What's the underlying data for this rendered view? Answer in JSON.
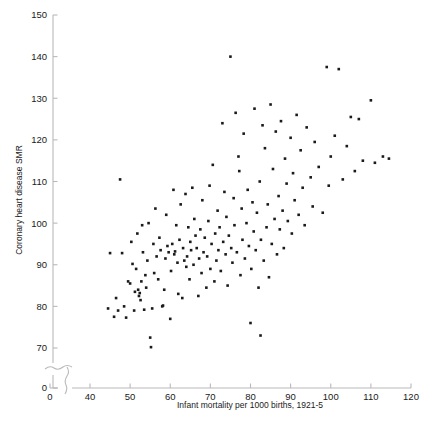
{
  "chart_data": {
    "type": "scatter",
    "title": "",
    "xlabel": "Infant mortality per 1000 births, 1921-5",
    "ylabel": "Coronary heart disease SMR",
    "xlim": [
      40,
      120
    ],
    "ylim": [
      70,
      150
    ],
    "x_ticks": [
      40,
      50,
      60,
      70,
      80,
      90,
      100,
      110,
      120
    ],
    "y_ticks": [
      70,
      80,
      90,
      100,
      110,
      120,
      130,
      140,
      150
    ],
    "x_origin_tick": 0,
    "y_origin_tick": 0,
    "axis_break": true,
    "grid": false,
    "legend": false,
    "marker": {
      "shape": "square",
      "size": 2.6,
      "color": "#1a1a1a"
    },
    "axis_color": "#b9b9b9",
    "n_points": 176,
    "points": [
      [
        44.5,
        79.5
      ],
      [
        45.0,
        92.8
      ],
      [
        46.0,
        77.5
      ],
      [
        46.5,
        82.0
      ],
      [
        47.0,
        79.0
      ],
      [
        47.5,
        110.5
      ],
      [
        48.0,
        92.8
      ],
      [
        48.5,
        80.0
      ],
      [
        49.0,
        77.3
      ],
      [
        49.5,
        86.0
      ],
      [
        50.0,
        85.5
      ],
      [
        50.3,
        95.5
      ],
      [
        50.6,
        90.2
      ],
      [
        51.0,
        79.0
      ],
      [
        51.2,
        83.5
      ],
      [
        51.5,
        89.0
      ],
      [
        51.8,
        97.5
      ],
      [
        52.0,
        84.0
      ],
      [
        52.2,
        82.5
      ],
      [
        52.4,
        83.2
      ],
      [
        52.6,
        81.5
      ],
      [
        52.8,
        86.0
      ],
      [
        53.0,
        99.5
      ],
      [
        53.2,
        93.0
      ],
      [
        53.5,
        79.2
      ],
      [
        53.8,
        87.5
      ],
      [
        54.0,
        84.5
      ],
      [
        54.3,
        91.0
      ],
      [
        54.6,
        100.0
      ],
      [
        55.0,
        72.5
      ],
      [
        55.2,
        70.2
      ],
      [
        55.5,
        79.5
      ],
      [
        55.8,
        95.0
      ],
      [
        56.0,
        88.0
      ],
      [
        56.3,
        103.5
      ],
      [
        56.6,
        92.0
      ],
      [
        57.0,
        86.5
      ],
      [
        57.3,
        96.5
      ],
      [
        57.6,
        93.5
      ],
      [
        58.0,
        80.0
      ],
      [
        58.2,
        80.2
      ],
      [
        58.5,
        84.0
      ],
      [
        58.8,
        91.5
      ],
      [
        59.0,
        102.0
      ],
      [
        59.3,
        94.5
      ],
      [
        59.6,
        93.0
      ],
      [
        60.0,
        77.0
      ],
      [
        60.2,
        88.5
      ],
      [
        60.5,
        95.0
      ],
      [
        60.8,
        108.0
      ],
      [
        61.0,
        92.5
      ],
      [
        61.2,
        93.2
      ],
      [
        61.5,
        99.5
      ],
      [
        61.8,
        90.5
      ],
      [
        62.0,
        83.0
      ],
      [
        62.3,
        96.0
      ],
      [
        62.6,
        104.5
      ],
      [
        63.0,
        82.0
      ],
      [
        63.2,
        94.0
      ],
      [
        63.5,
        91.0
      ],
      [
        63.8,
        107.0
      ],
      [
        64.0,
        89.5
      ],
      [
        64.2,
        92.0
      ],
      [
        64.5,
        99.0
      ],
      [
        64.8,
        86.5
      ],
      [
        65.0,
        95.5
      ],
      [
        65.2,
        93.5
      ],
      [
        65.5,
        108.5
      ],
      [
        65.8,
        90.0
      ],
      [
        66.0,
        101.0
      ],
      [
        66.3,
        97.0
      ],
      [
        66.6,
        94.0
      ],
      [
        67.0,
        82.5
      ],
      [
        67.2,
        91.5
      ],
      [
        67.5,
        98.5
      ],
      [
        67.8,
        88.0
      ],
      [
        68.0,
        105.5
      ],
      [
        68.3,
        93.0
      ],
      [
        68.6,
        96.5
      ],
      [
        69.0,
        84.5
      ],
      [
        69.2,
        92.0
      ],
      [
        69.5,
        100.5
      ],
      [
        69.8,
        109.0
      ],
      [
        70.0,
        89.0
      ],
      [
        70.3,
        95.0
      ],
      [
        70.6,
        114.0
      ],
      [
        71.0,
        86.0
      ],
      [
        71.2,
        97.5
      ],
      [
        71.5,
        91.0
      ],
      [
        71.8,
        103.0
      ],
      [
        72.0,
        93.5
      ],
      [
        72.3,
        99.0
      ],
      [
        72.6,
        88.5
      ],
      [
        73.0,
        124.0
      ],
      [
        73.2,
        95.5
      ],
      [
        73.5,
        107.5
      ],
      [
        73.8,
        92.5
      ],
      [
        74.0,
        101.5
      ],
      [
        74.3,
        85.0
      ],
      [
        74.6,
        97.0
      ],
      [
        75.0,
        140.0
      ],
      [
        75.2,
        94.0
      ],
      [
        75.5,
        90.5
      ],
      [
        75.8,
        106.0
      ],
      [
        76.0,
        99.5
      ],
      [
        76.3,
        126.5
      ],
      [
        76.6,
        93.0
      ],
      [
        77.0,
        116.0
      ],
      [
        77.2,
        112.5
      ],
      [
        77.5,
        87.5
      ],
      [
        77.8,
        103.5
      ],
      [
        78.0,
        96.0
      ],
      [
        78.3,
        121.5
      ],
      [
        78.6,
        91.5
      ],
      [
        79.0,
        100.0
      ],
      [
        79.3,
        108.0
      ],
      [
        79.6,
        94.5
      ],
      [
        80.0,
        76.0
      ],
      [
        80.2,
        89.0
      ],
      [
        80.5,
        105.0
      ],
      [
        80.8,
        98.0
      ],
      [
        81.0,
        127.5
      ],
      [
        81.3,
        93.5
      ],
      [
        81.6,
        102.5
      ],
      [
        82.0,
        84.5
      ],
      [
        82.3,
        110.0
      ],
      [
        82.6,
        96.0
      ],
      [
        82.5,
        73.0
      ],
      [
        83.0,
        123.5
      ],
      [
        83.3,
        91.0
      ],
      [
        83.6,
        118.0
      ],
      [
        84.0,
        99.0
      ],
      [
        84.3,
        104.5
      ],
      [
        84.6,
        87.0
      ],
      [
        85.0,
        128.5
      ],
      [
        85.3,
        95.0
      ],
      [
        85.6,
        113.0
      ],
      [
        86.0,
        101.0
      ],
      [
        86.3,
        122.0
      ],
      [
        86.6,
        92.5
      ],
      [
        87.0,
        106.5
      ],
      [
        87.3,
        98.5
      ],
      [
        87.6,
        124.5
      ],
      [
        88.0,
        103.0
      ],
      [
        88.3,
        94.0
      ],
      [
        88.6,
        115.5
      ],
      [
        89.0,
        109.5
      ],
      [
        89.3,
        100.5
      ],
      [
        90.0,
        120.5
      ],
      [
        90.3,
        97.5
      ],
      [
        90.6,
        112.0
      ],
      [
        91.0,
        105.5
      ],
      [
        91.5,
        126.0
      ],
      [
        92.0,
        102.0
      ],
      [
        92.5,
        117.5
      ],
      [
        93.0,
        108.5
      ],
      [
        93.5,
        99.5
      ],
      [
        94.0,
        123.0
      ],
      [
        95.0,
        111.0
      ],
      [
        95.5,
        104.0
      ],
      [
        96.0,
        119.5
      ],
      [
        97.0,
        113.5
      ],
      [
        98.0,
        102.5
      ],
      [
        99.0,
        137.5
      ],
      [
        99.5,
        109.0
      ],
      [
        100.0,
        116.0
      ],
      [
        101.0,
        121.0
      ],
      [
        102.0,
        137.0
      ],
      [
        103.0,
        110.5
      ],
      [
        104.0,
        118.5
      ],
      [
        105.0,
        125.5
      ],
      [
        106.0,
        112.5
      ],
      [
        107.0,
        125.0
      ],
      [
        108.0,
        115.0
      ],
      [
        110.0,
        129.5
      ],
      [
        111.0,
        114.5
      ],
      [
        113.0,
        116.0
      ],
      [
        114.5,
        115.5
      ]
    ]
  }
}
